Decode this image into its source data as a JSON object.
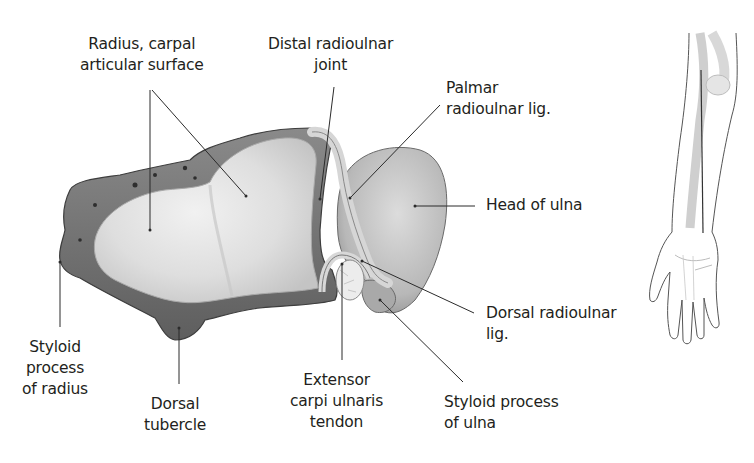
{
  "figure": {
    "colors": {
      "background": "#ffffff",
      "text": "#231f20",
      "leader_line": "#2b2b2b",
      "bone_cortex": "#6e6e6e",
      "articular_surface": "#dcdcdc",
      "ulna_head": "#bdbdbd"
    }
  },
  "labels": {
    "radius_surface": {
      "lines": [
        "Radius, carpal",
        "articular surface"
      ]
    },
    "distal_ru_joint": {
      "lines": [
        "Distal radioulnar",
        "joint"
      ]
    },
    "palmar_lig": {
      "lines": [
        "Palmar",
        "radioulnar lig."
      ]
    },
    "head_ulna": {
      "lines": [
        "Head of ulna"
      ]
    },
    "dorsal_lig": {
      "lines": [
        "Dorsal radioulnar",
        "lig."
      ]
    },
    "styloid_ulna": {
      "lines": [
        "Styloid process",
        "of ulna"
      ]
    },
    "ecu_tendon": {
      "lines": [
        "Extensor",
        "carpi ulnaris",
        "tendon"
      ]
    },
    "dorsal_tubercle": {
      "lines": [
        "Dorsal",
        "tubercle"
      ]
    },
    "styloid_radius": {
      "lines": [
        "Styloid",
        "process",
        "of radius"
      ]
    }
  },
  "inset": {
    "description": "Forearm and hand orientation sketch with section line"
  }
}
